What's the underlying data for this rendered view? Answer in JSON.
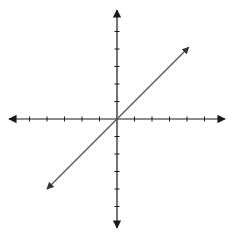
{
  "chart_data": {
    "type": "line",
    "title": "",
    "xlabel": "",
    "ylabel": "",
    "xlim": [
      -6,
      6
    ],
    "ylim": [
      -6,
      6
    ],
    "grid": false,
    "legend": null,
    "axes": {
      "x_ticks": [
        -5,
        -4,
        -3,
        -2,
        -1,
        1,
        2,
        3,
        4,
        5
      ],
      "y_ticks": [
        -5,
        -4,
        -3,
        -2,
        -1,
        1,
        2,
        3,
        4,
        5
      ],
      "tick_labels_shown": false,
      "arrows_on_both_ends": true
    },
    "series": [
      {
        "name": "y = x",
        "x": [
          -4.0,
          0,
          4.1
        ],
        "y": [
          -4.0,
          0,
          4.1
        ],
        "arrows_on_both_ends": true
      }
    ]
  },
  "colors": {
    "axis": "#1a1a1a",
    "line": "#555555",
    "background": "#ffffff"
  },
  "layout": {
    "origin_px": [
      117,
      119
    ],
    "unit_px": 17.5
  }
}
